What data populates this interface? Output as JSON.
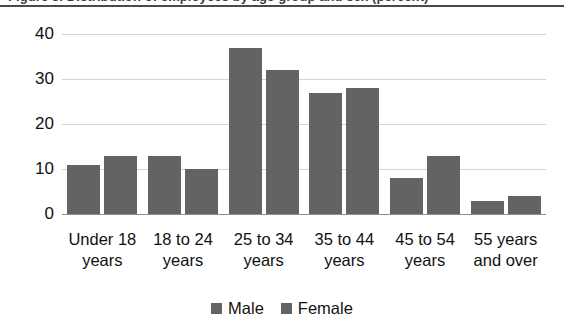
{
  "title_strip": {
    "clipped_title": "Figure 3. Distribution of employees by age group and sex (percent)",
    "rule_color": "#4a4a4a"
  },
  "colors": {
    "bar": "#636363",
    "gridline": "#d4d4d4",
    "axis": "#8f8f8f",
    "text": "#111111"
  },
  "legend": {
    "position": "bottom-center",
    "entries": [
      {
        "label": "Male",
        "color": "#636363",
        "swatch": "square-swatch"
      },
      {
        "label": "Female",
        "color": "#636363",
        "swatch": "square-swatch"
      }
    ]
  },
  "chart_data": {
    "type": "bar",
    "title": "",
    "xlabel": "",
    "ylabel": "",
    "ylim": [
      0,
      40
    ],
    "yticks": [
      0,
      10,
      20,
      30,
      40
    ],
    "ytick_labels": [
      "0",
      "10",
      "20",
      "30",
      "40"
    ],
    "grid": true,
    "grid_axis": "y",
    "legend_position": "bottom",
    "categories": [
      "Under 18 years",
      "18 to 24 years",
      "25 to 34 years",
      "35 to 44 years",
      "45 to 54 years",
      "55 years and over"
    ],
    "category_lines": [
      [
        "Under 18",
        "years"
      ],
      [
        "18 to 24",
        "years"
      ],
      [
        "25 to 34",
        "years"
      ],
      [
        "35 to 44",
        "years"
      ],
      [
        "45 to 54",
        "years"
      ],
      [
        "55 years",
        "and over"
      ]
    ],
    "series": [
      {
        "name": "Male",
        "color": "#636363",
        "values": [
          11,
          13,
          37,
          27,
          8,
          3
        ]
      },
      {
        "name": "Female",
        "color": "#636363",
        "values": [
          13,
          10,
          32,
          28,
          13,
          4
        ]
      }
    ]
  }
}
